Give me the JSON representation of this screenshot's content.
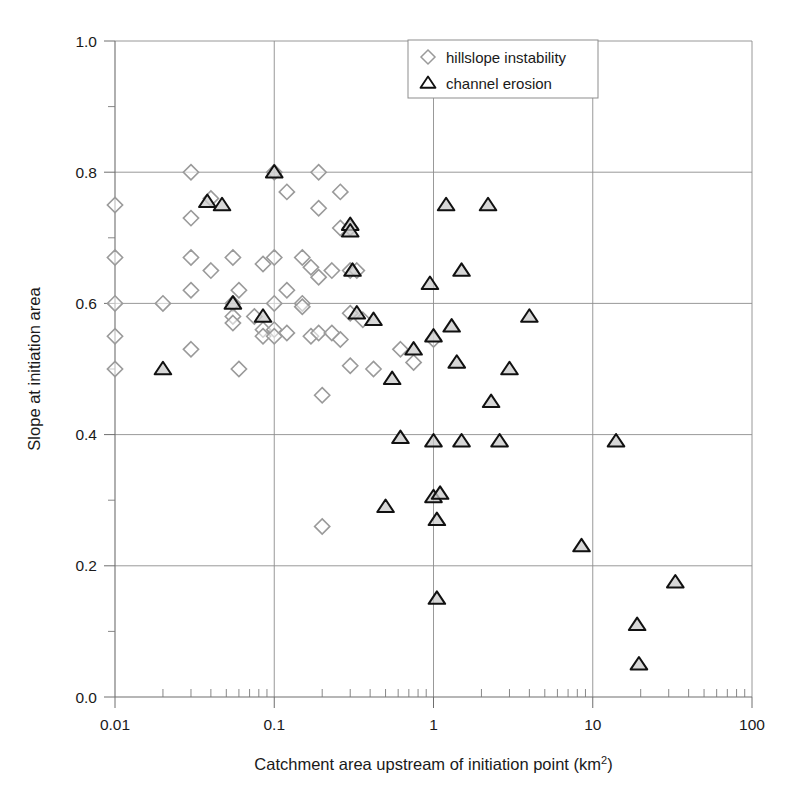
{
  "chart_data": {
    "type": "scatter",
    "title": "",
    "xlabel": "Catchment area upstream of initiation point (km2)",
    "xlabel_main": "Catchment area upstream of initiation point (km",
    "xlabel_sup": "2",
    "xlabel_tail": ")",
    "ylabel": "Slope at initiation area",
    "xscale": "log",
    "yscale": "linear",
    "xlim": [
      0.01,
      100
    ],
    "ylim": [
      0.0,
      1.0
    ],
    "grid": true,
    "legend_position": "top-center",
    "xticks": [
      "0.01",
      "0.1",
      "1",
      "10",
      "100"
    ],
    "xtick_values": [
      0.01,
      0.1,
      1,
      10,
      100
    ],
    "yticks": [
      "0.0",
      "0.2",
      "0.4",
      "0.6",
      "0.8",
      "1.0"
    ],
    "ytick_values": [
      0.0,
      0.2,
      0.4,
      0.6,
      0.8,
      1.0
    ],
    "yminor_values": [
      0.1,
      0.3,
      0.5,
      0.7,
      0.9
    ],
    "series": [
      {
        "name": "hillslope instability",
        "marker": "diamond",
        "color": "#9a9a9a",
        "points": [
          [
            0.01,
            0.75
          ],
          [
            0.01,
            0.67
          ],
          [
            0.01,
            0.6
          ],
          [
            0.01,
            0.55
          ],
          [
            0.01,
            0.5
          ],
          [
            0.02,
            0.6
          ],
          [
            0.03,
            0.8
          ],
          [
            0.03,
            0.73
          ],
          [
            0.03,
            0.67
          ],
          [
            0.03,
            0.62
          ],
          [
            0.03,
            0.53
          ],
          [
            0.04,
            0.76
          ],
          [
            0.04,
            0.65
          ],
          [
            0.055,
            0.67
          ],
          [
            0.055,
            0.6
          ],
          [
            0.055,
            0.58
          ],
          [
            0.055,
            0.57
          ],
          [
            0.06,
            0.62
          ],
          [
            0.06,
            0.5
          ],
          [
            0.075,
            0.58
          ],
          [
            0.085,
            0.66
          ],
          [
            0.085,
            0.56
          ],
          [
            0.085,
            0.55
          ],
          [
            0.1,
            0.8
          ],
          [
            0.1,
            0.67
          ],
          [
            0.1,
            0.6
          ],
          [
            0.1,
            0.56
          ],
          [
            0.1,
            0.55
          ],
          [
            0.12,
            0.77
          ],
          [
            0.12,
            0.62
          ],
          [
            0.12,
            0.555
          ],
          [
            0.15,
            0.67
          ],
          [
            0.15,
            0.6
          ],
          [
            0.15,
            0.595
          ],
          [
            0.17,
            0.655
          ],
          [
            0.17,
            0.55
          ],
          [
            0.19,
            0.8
          ],
          [
            0.19,
            0.745
          ],
          [
            0.19,
            0.64
          ],
          [
            0.19,
            0.555
          ],
          [
            0.2,
            0.46
          ],
          [
            0.2,
            0.26
          ],
          [
            0.23,
            0.65
          ],
          [
            0.23,
            0.555
          ],
          [
            0.26,
            0.77
          ],
          [
            0.26,
            0.715
          ],
          [
            0.26,
            0.545
          ],
          [
            0.3,
            0.715
          ],
          [
            0.3,
            0.65
          ],
          [
            0.3,
            0.585
          ],
          [
            0.3,
            0.505
          ],
          [
            0.33,
            0.65
          ],
          [
            0.36,
            0.575
          ],
          [
            0.42,
            0.5
          ],
          [
            0.62,
            0.53
          ],
          [
            0.75,
            0.51
          ],
          [
            1.0,
            0.545
          ]
        ]
      },
      {
        "name": "channel erosion",
        "marker": "triangle",
        "color": "#111111",
        "points": [
          [
            0.02,
            0.5
          ],
          [
            0.038,
            0.755
          ],
          [
            0.047,
            0.75
          ],
          [
            0.055,
            0.6
          ],
          [
            0.085,
            0.58
          ],
          [
            0.1,
            0.8
          ],
          [
            0.3,
            0.72
          ],
          [
            0.3,
            0.71
          ],
          [
            0.31,
            0.65
          ],
          [
            0.33,
            0.585
          ],
          [
            0.42,
            0.575
          ],
          [
            0.5,
            0.29
          ],
          [
            0.55,
            0.485
          ],
          [
            0.62,
            0.395
          ],
          [
            0.75,
            0.53
          ],
          [
            0.95,
            0.63
          ],
          [
            1.0,
            0.55
          ],
          [
            1.0,
            0.39
          ],
          [
            1.0,
            0.305
          ],
          [
            1.1,
            0.31
          ],
          [
            1.05,
            0.27
          ],
          [
            1.05,
            0.15
          ],
          [
            1.2,
            0.75
          ],
          [
            1.3,
            0.565
          ],
          [
            1.4,
            0.51
          ],
          [
            1.5,
            0.65
          ],
          [
            1.5,
            0.39
          ],
          [
            2.2,
            0.75
          ],
          [
            2.3,
            0.45
          ],
          [
            2.6,
            0.39
          ],
          [
            3.0,
            0.5
          ],
          [
            4.0,
            0.58
          ],
          [
            8.5,
            0.23
          ],
          [
            14.0,
            0.39
          ],
          [
            19.0,
            0.11
          ],
          [
            19.5,
            0.05
          ],
          [
            33.0,
            0.175
          ]
        ]
      }
    ]
  },
  "legend": {
    "items": [
      {
        "label": "hillslope instability",
        "marker": "diamond"
      },
      {
        "label": "channel erosion",
        "marker": "triangle"
      }
    ]
  }
}
